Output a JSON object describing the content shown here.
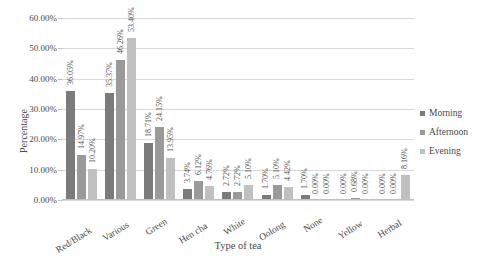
{
  "chart_data": {
    "type": "bar",
    "title": "",
    "xlabel": "Type of tea",
    "ylabel": "Percentage",
    "ylim": [
      0,
      60
    ],
    "ytick_labels": [
      "0.00%",
      "10.00%",
      "20.00%",
      "30.00%",
      "40.00%",
      "50.00%",
      "60.00%"
    ],
    "ytick_values": [
      0,
      10,
      20,
      30,
      40,
      50,
      60
    ],
    "grid": true,
    "legend_position": "right",
    "categories": [
      "Red/Black",
      "Various",
      "Green",
      "Hen cha",
      "White",
      "Oolong",
      "None",
      "Yellow",
      "Herbal"
    ],
    "series": [
      {
        "name": "Morning",
        "color": "#7b7b7b",
        "values": [
          36.05,
          35.37,
          18.71,
          3.74,
          2.72,
          1.7,
          1.7,
          0.0,
          0.0
        ],
        "labels": [
          "36.05%",
          "35.37%",
          "18.71%",
          "3.74%",
          "2.72%",
          "1.70%",
          "1.70%",
          "0.00%",
          "0.00%"
        ]
      },
      {
        "name": "Afternoon",
        "color": "#9a9a9a",
        "values": [
          14.97,
          46.26,
          24.15,
          6.12,
          2.72,
          5.1,
          0.0,
          0.68,
          0.0
        ],
        "labels": [
          "14.97%",
          "46.26%",
          "24.15%",
          "6.12%",
          "2.72%",
          "5.10%",
          "0.00%",
          "0.68%",
          "0.00%"
        ]
      },
      {
        "name": "Evening",
        "color": "#c0c0c0",
        "values": [
          10.2,
          53.4,
          13.95,
          4.76,
          5.1,
          4.42,
          0.0,
          0.0,
          8.16
        ],
        "labels": [
          "10.20%",
          "53.40%",
          "13.95%",
          "4.76%",
          "5.10%",
          "4.42%",
          "0.00%",
          "0.00%",
          "8.16%"
        ]
      }
    ]
  }
}
